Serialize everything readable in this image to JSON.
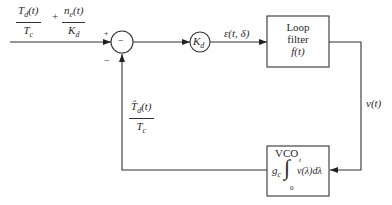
{
  "diagram": {
    "type": "block-diagram",
    "input": {
      "term1": {
        "numerator": "T_d(t)",
        "denominator": "T_c"
      },
      "operator": "+",
      "term2": {
        "numerator": "n_e(t)",
        "denominator": "K_d"
      }
    },
    "summing_junction": {
      "symbol": "−",
      "plus_sign": "+",
      "minus_sign": "−"
    },
    "gain_block": {
      "label": "K_d"
    },
    "error_signal": "ε(t, δ)",
    "loop_filter": {
      "line1": "Loop",
      "line2": "filter",
      "line3": "f(t)"
    },
    "filter_output": "v(t)",
    "vco": {
      "title": "VCO",
      "gain": "g_c",
      "upper_limit": "t",
      "lower_limit": "0",
      "integrand": "v(λ)dλ"
    },
    "feedback": {
      "numerator": "T̂_d(t)",
      "denominator": "T_c"
    },
    "colors": {
      "line": "#333333",
      "background": "#ffffff"
    }
  }
}
